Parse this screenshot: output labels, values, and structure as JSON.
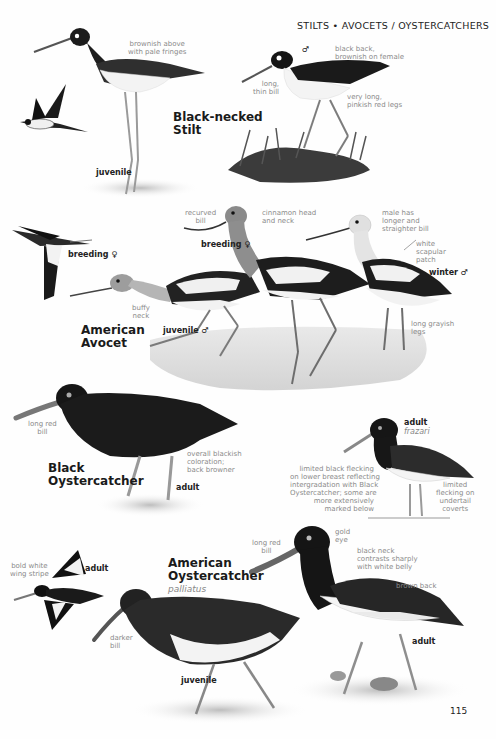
{
  "header": {
    "section_title": "STILTS • AVOCETS / OYSTERCATCHERS"
  },
  "page_number": "115",
  "species": [
    {
      "name": "Black-necked Stilt",
      "name_line1": "Black-necked",
      "name_line2": "Stilt",
      "plates": [
        {
          "label": "juvenile",
          "notes": [
            "brownish above with pale fringes"
          ]
        },
        {
          "label": "flight",
          "notes": []
        },
        {
          "label": "♂",
          "notes": [
            "black back, brownish on female",
            "long, thin bill",
            "very long, pinkish red legs"
          ]
        }
      ]
    },
    {
      "name": "American Avocet",
      "name_line1": "American",
      "name_line2": "Avocet",
      "plates": [
        {
          "label": "breeding ♀",
          "type": "flight",
          "notes": []
        },
        {
          "label": "breeding ♀",
          "notes": [
            "recurved bill",
            "cinnamon head and neck"
          ]
        },
        {
          "label": "juvenile ♂",
          "notes": [
            "buffy neck"
          ]
        },
        {
          "label": "winter ♂",
          "notes": [
            "male has longer and straighter bill",
            "white scapular patch",
            "long grayish legs"
          ]
        }
      ]
    },
    {
      "name": "Black Oystercatcher",
      "name_line1": "Black",
      "name_line2": "Oystercatcher",
      "plates": [
        {
          "label": "adult",
          "notes": [
            "long red bill",
            "overall blackish coloration; back browner"
          ]
        }
      ]
    },
    {
      "name": "American Oystercatcher",
      "name_line1": "American",
      "name_line2": "Oystercatcher",
      "subspecies": "palliatus",
      "plates": [
        {
          "label": "adult",
          "subspecies": "frazari",
          "notes": [
            "limited black flecking on lower breast reflecting intergradation with Black Oystercatcher; some are more extensively marked below",
            "limited flecking on undertail coverts"
          ]
        },
        {
          "label": "adult",
          "type": "flight",
          "notes": [
            "bold white wing stripe"
          ]
        },
        {
          "label": "juvenile",
          "notes": [
            "darker bill"
          ]
        },
        {
          "label": "adult",
          "notes": [
            "long red bill",
            "gold eye",
            "black neck contrasts sharply with white belly",
            "brown back"
          ]
        }
      ]
    }
  ],
  "labels": {
    "stilt_juv_note": [
      "brownish above",
      "with pale fringes"
    ],
    "stilt_juv_tag": "juvenile",
    "stilt_male_sym": "♂",
    "stilt_back_note": [
      "black back,",
      "brownish on female"
    ],
    "stilt_bill_note": [
      "long,",
      "thin bill"
    ],
    "stilt_legs_note": [
      "very long,",
      "pinkish red legs"
    ],
    "avocet_flight_tag": "breeding ♀",
    "avocet_recurved_note": [
      "recurved",
      "bill"
    ],
    "avocet_breeding_tag": "breeding ♀",
    "avocet_cinnamon_note": [
      "cinnamon head",
      "and neck"
    ],
    "avocet_male_note": [
      "male has",
      "longer and",
      "straighter bill"
    ],
    "avocet_scapular_note": [
      "white",
      "scapular",
      "patch"
    ],
    "avocet_winter_tag": "winter ♂",
    "avocet_buffy_note": [
      "buffy",
      "neck"
    ],
    "avocet_juv_tag": "juvenile ♂",
    "avocet_legs_note": [
      "long grayish",
      "legs"
    ],
    "bo_bill_note": [
      "long red",
      "bill"
    ],
    "bo_color_note": [
      "overall blackish",
      "coloration;",
      "back browner"
    ],
    "bo_adult_tag": "adult",
    "frazari_tag": "adult",
    "frazari_sub": "frazari",
    "frazari_fleck_note": [
      "limited black flecking",
      "on lower breast reflecting",
      "intergradation with Black",
      "Oystercatcher; some are",
      "more extensively",
      "marked below"
    ],
    "frazari_under_note": [
      "limited",
      "flecking on",
      "undertail",
      "coverts"
    ],
    "ao_wing_note": [
      "bold white",
      "wing stripe"
    ],
    "ao_flight_tag": "adult",
    "ao_bill_note": [
      "long red",
      "bill"
    ],
    "ao_eye_note": [
      "gold",
      "eye"
    ],
    "ao_neck_note": [
      "black neck",
      "contrasts sharply",
      "with white belly"
    ],
    "ao_back_note": "brown back",
    "ao_adult_tag": "adult",
    "ao_darker_note": [
      "darker",
      "bill"
    ],
    "ao_juv_tag": "juvenile"
  },
  "colors": {
    "page_bg": "#fefefe",
    "ink": "#1a1a1a",
    "note_gray": "#8a8a8a"
  }
}
